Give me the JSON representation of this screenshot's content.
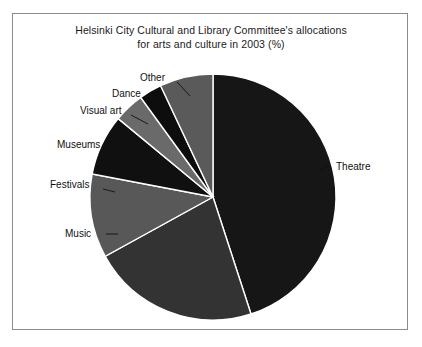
{
  "chart_data": {
    "type": "pie",
    "title": "Helsinki City Cultural and Library Committee's allocations for arts and culture in 2003 (%)",
    "title_line_1": "Helsinki City Cultural and Library Committee's allocations",
    "title_line_2": "for arts and culture in 2003 (%)",
    "unit": "%",
    "legend_position": "none",
    "labels_position": "outside-leader-lines",
    "start_angle_deg": 0,
    "direction": "clockwise",
    "categories": [
      "Theatre",
      "Music",
      "Festivals",
      "Museums",
      "Visual art",
      "Dance",
      "Other"
    ],
    "values": [
      45,
      22,
      11,
      8,
      4,
      3,
      7
    ],
    "colors": [
      "#161616",
      "#333333",
      "#585858",
      "#101010",
      "#6a6a6a",
      "#0d0d0d",
      "#5a5a5a"
    ],
    "slices": [
      {
        "label": "Theatre",
        "value": 45,
        "color": "#161616"
      },
      {
        "label": "Music",
        "value": 22,
        "color": "#333333"
      },
      {
        "label": "Festivals",
        "value": 11,
        "color": "#585858"
      },
      {
        "label": "Museums",
        "value": 8,
        "color": "#101010"
      },
      {
        "label": "Visual art",
        "value": 4,
        "color": "#6a6a6a"
      },
      {
        "label": "Dance",
        "value": 3,
        "color": "#0d0d0d"
      },
      {
        "label": "Other",
        "value": 7,
        "color": "#5a5a5a"
      }
    ]
  },
  "figure": {
    "frame_color": "#8c8c8c",
    "background": "#ffffff",
    "slice_edge_color": "#ffffff"
  },
  "labels": {
    "theatre": "Theatre",
    "music": "Music",
    "festivals": "Festivals",
    "museums": "Museums",
    "visual_art": "Visual art",
    "dance": "Dance",
    "other": "Other"
  }
}
